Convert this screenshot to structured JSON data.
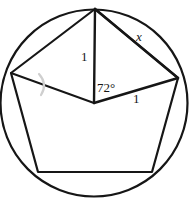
{
  "figure": {
    "labels": {
      "radius_vertical": "1",
      "radius_horizontal": "1",
      "central_angle": "72°",
      "unknown_side": "x"
    },
    "top_cropped_text": "⌣ ⌣ ⌣ ⌣",
    "colors": {
      "stroke": "#161616",
      "background": "#ffffff",
      "faint_mark": "#cfcfcf"
    },
    "geometry": {
      "circle": {
        "cx": 94,
        "cy": 103,
        "r": 94
      },
      "vertices": [
        {
          "name": "top",
          "x": 95,
          "y": 9
        },
        {
          "name": "right",
          "x": 178,
          "y": 78
        },
        {
          "name": "bottom-right",
          "x": 152,
          "y": 172
        },
        {
          "name": "bottom-left",
          "x": 38,
          "y": 172
        },
        {
          "name": "left",
          "x": 11,
          "y": 73
        }
      ],
      "center": {
        "x": 94,
        "y": 103
      },
      "radii_drawn": [
        "top",
        "right",
        "left"
      ],
      "central_angle_degrees": 72,
      "radius_length": 1
    }
  }
}
